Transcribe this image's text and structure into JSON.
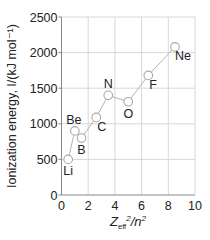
{
  "chart_data": {
    "type": "line",
    "title": "",
    "xlabel": "Z_eff^2/n^2",
    "xlabel_parts": {
      "main": "Z",
      "sub": "eff",
      "sup": "2",
      "rest": "/n",
      "rest_sup": "2"
    },
    "ylabel": "Ionization energy, I/(kJ mol⁻¹)",
    "xlim": [
      0,
      10
    ],
    "ylim": [
      0,
      2500
    ],
    "xticks": [
      0,
      2,
      4,
      6,
      8,
      10
    ],
    "yticks": [
      0,
      500,
      1000,
      1500,
      2000,
      2500
    ],
    "grid": true,
    "legend": null,
    "series": [
      {
        "name": "Period 2 elements",
        "points": [
          {
            "label": "Li",
            "x": 0.5,
            "y": 500,
            "label_pos": "below"
          },
          {
            "label": "Be",
            "x": 1.0,
            "y": 900,
            "label_pos": "above"
          },
          {
            "label": "B",
            "x": 1.5,
            "y": 800,
            "label_pos": "below"
          },
          {
            "label": "C",
            "x": 2.6,
            "y": 1090,
            "label_pos": "below-right"
          },
          {
            "label": "N",
            "x": 3.5,
            "y": 1400,
            "label_pos": "above"
          },
          {
            "label": "O",
            "x": 5.0,
            "y": 1310,
            "label_pos": "below"
          },
          {
            "label": "F",
            "x": 6.5,
            "y": 1680,
            "label_pos": "below-right"
          },
          {
            "label": "Ne",
            "x": 8.5,
            "y": 2080,
            "label_pos": "below-right"
          }
        ]
      }
    ],
    "colors": {
      "line": "#b5b5b5",
      "marker_fill": "#ffffff",
      "marker_stroke": "#a8a8a8",
      "grid": "#d4d4d4",
      "axis": "#888888",
      "text": "#222222"
    }
  }
}
